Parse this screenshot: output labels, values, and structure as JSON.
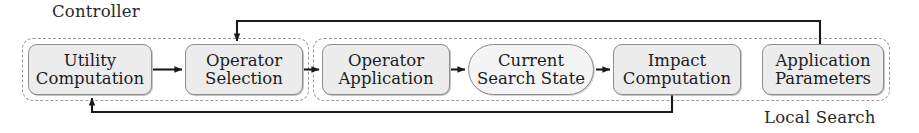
{
  "diagram": {
    "groups": [
      {
        "id": "controller",
        "label": "Controller"
      },
      {
        "id": "local_search",
        "label": "Local Search"
      }
    ],
    "nodes": [
      {
        "id": "utility",
        "group": "controller",
        "line1": "Utility",
        "line2": "Computation",
        "shape": "rounded-rect",
        "fill": "#ececec"
      },
      {
        "id": "opsel",
        "group": "controller",
        "line1": "Operator",
        "line2": "Selection",
        "shape": "rounded-rect",
        "fill": "#ececec"
      },
      {
        "id": "opapp",
        "group": "local_search",
        "line1": "Operator",
        "line2": "Application",
        "shape": "rounded-rect",
        "fill": "#ececec"
      },
      {
        "id": "state",
        "group": "local_search",
        "line1": "Current",
        "line2": "Search State",
        "shape": "stadium",
        "fill": "#f4f4f4"
      },
      {
        "id": "impact",
        "group": "local_search",
        "line1": "Impact",
        "line2": "Computation",
        "shape": "rounded-rect",
        "fill": "#ececec"
      },
      {
        "id": "appparams",
        "group": "local_search",
        "line1": "Application",
        "line2": "Parameters",
        "shape": "rounded-rect",
        "fill": "#ececec"
      }
    ],
    "edges": [
      {
        "from": "utility",
        "to": "opsel",
        "style": "straight-right"
      },
      {
        "from": "opsel",
        "to": "opapp",
        "style": "straight-right"
      },
      {
        "from": "opapp",
        "to": "state",
        "style": "straight-right"
      },
      {
        "from": "state",
        "to": "impact",
        "style": "straight-right"
      },
      {
        "from": "appparams",
        "to": "opsel",
        "style": "top-feedback"
      },
      {
        "from": "impact",
        "to": "utility",
        "style": "bottom-feedback"
      }
    ],
    "colors": {
      "node_fill": "#ececec",
      "node_fill_state": "#f4f4f4",
      "node_stroke": "#8d8d8d",
      "group_stroke": "#9a9a9a",
      "wire": "#1a1a1a",
      "text": "#1c1d1f",
      "background": "#ffffff"
    }
  }
}
